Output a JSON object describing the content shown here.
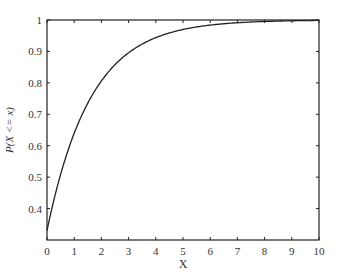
{
  "chart_data": {
    "type": "line",
    "title": "",
    "xlabel": "X",
    "ylabel": "P(X <= x)",
    "xlim": [
      0,
      10
    ],
    "ylim": [
      0.3,
      1
    ],
    "xticks": [
      "0",
      "1",
      "2",
      "3",
      "4",
      "5",
      "6",
      "7",
      "8",
      "9",
      "10"
    ],
    "yticks": [
      "0.4",
      "0.5",
      "0.6",
      "0.7",
      "0.8",
      "0.9",
      "1"
    ],
    "grid": false,
    "legend": null,
    "series": [
      {
        "name": "CDF",
        "color": "#222222",
        "x": [
          0,
          0.5,
          1,
          1.5,
          2,
          2.5,
          3,
          3.5,
          4,
          4.5,
          5,
          6,
          7,
          8,
          9,
          10
        ],
        "y": [
          0.33,
          0.51,
          0.64,
          0.74,
          0.81,
          0.86,
          0.9,
          0.925,
          0.945,
          0.96,
          0.97,
          0.984,
          0.991,
          0.995,
          0.997,
          0.998
        ]
      }
    ]
  }
}
